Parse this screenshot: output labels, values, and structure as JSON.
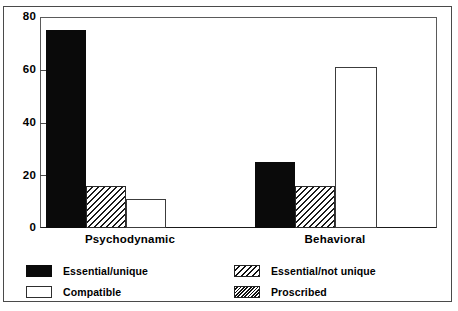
{
  "chart_data": {
    "type": "bar",
    "title": "",
    "subtitle": "",
    "xlabel": "",
    "ylabel": "",
    "categories": [
      "Psychodynamic",
      "Behavioral"
    ],
    "series": [
      {
        "name": "Essential/unique",
        "pattern": "solid",
        "values": [
          75,
          25
        ]
      },
      {
        "name": "Essential/not unique",
        "pattern": "hatch",
        "values": [
          16,
          16
        ]
      },
      {
        "name": "Compatible",
        "pattern": "open",
        "values": [
          11,
          61
        ]
      },
      {
        "name": "Proscribed",
        "pattern": "dense",
        "values": [
          0,
          0
        ]
      }
    ],
    "ylim": [
      0,
      80
    ],
    "yticks": [
      0,
      20,
      40,
      60,
      80
    ],
    "ytick_labels": [
      "0",
      "20",
      "40",
      "60",
      "80"
    ],
    "grid": false,
    "legend_position": "bottom",
    "colors": {
      "solid": "#0a0a0a",
      "hatch": "#1a1a1a",
      "open": "#ffffff",
      "dense": "#111111",
      "axis": "#4a4a4a",
      "background": "#ffffff"
    }
  },
  "axis": {
    "ticks": [
      {
        "label": "80",
        "value": 80
      },
      {
        "label": "60",
        "value": 60
      },
      {
        "label": "40",
        "value": 40
      },
      {
        "label": "20",
        "value": 20
      },
      {
        "label": "0",
        "value": 0
      }
    ]
  },
  "groups": [
    {
      "label": "Psychodynamic"
    },
    {
      "label": "Behavioral"
    }
  ],
  "legend": {
    "items": [
      {
        "label": "Essential/unique"
      },
      {
        "label": "Essential/not unique"
      },
      {
        "label": "Compatible"
      },
      {
        "label": "Proscribed"
      }
    ]
  }
}
